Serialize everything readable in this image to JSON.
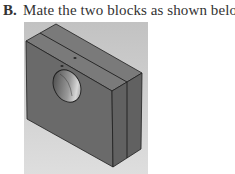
{
  "step": {
    "label": "B.",
    "text": "Mate the two blocks as shown below."
  },
  "figure": {
    "colors": {
      "viewport_bg_top": "#c4c4c4",
      "viewport_bg_bottom": "#dcdcdc",
      "front_face": "#6c6c6c",
      "top_face": "#7a7a7a",
      "side_face": "#636363",
      "edge": "#1e1e1e"
    }
  }
}
